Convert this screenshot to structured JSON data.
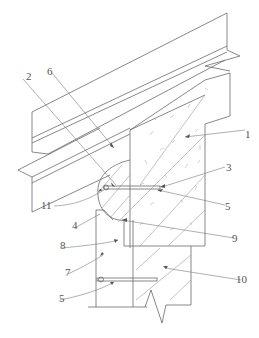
{
  "figure": {
    "type": "technical-section-drawing",
    "line_color": "#6a6a6a",
    "background": "#ffffff"
  },
  "labels": [
    {
      "id": "1",
      "text": "1"
    },
    {
      "id": "2",
      "text": "2"
    },
    {
      "id": "3",
      "text": "3"
    },
    {
      "id": "4",
      "text": "4"
    },
    {
      "id": "5a",
      "text": "5"
    },
    {
      "id": "5b",
      "text": "5"
    },
    {
      "id": "6",
      "text": "6"
    },
    {
      "id": "7",
      "text": "7"
    },
    {
      "id": "8",
      "text": "8"
    },
    {
      "id": "9",
      "text": "9"
    },
    {
      "id": "10",
      "text": "10"
    },
    {
      "id": "11",
      "text": "11"
    }
  ]
}
